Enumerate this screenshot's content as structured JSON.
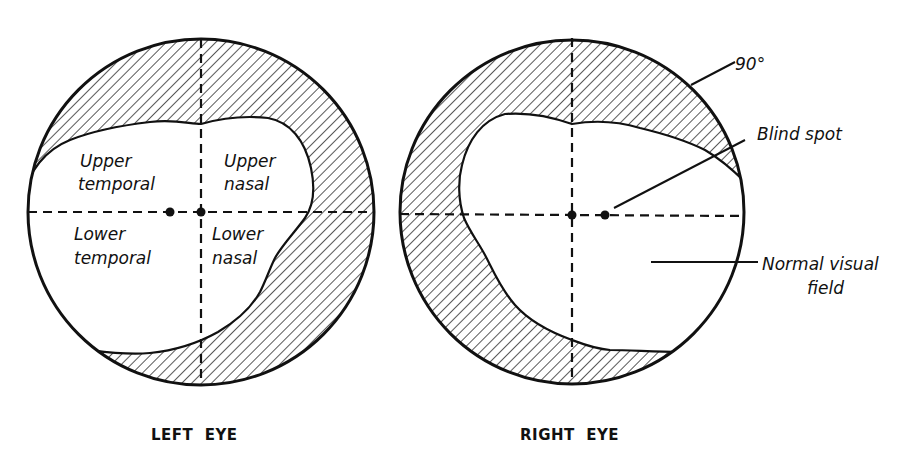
{
  "figure": {
    "left_eye": {
      "caption": "LEFT  EYE",
      "quadrants": {
        "upper_temporal": [
          "Upper",
          "temporal"
        ],
        "upper_nasal": [
          "Upper",
          "nasal"
        ],
        "lower_temporal": [
          "Lower",
          "temporal"
        ],
        "lower_nasal": [
          "Lower",
          "nasal"
        ]
      }
    },
    "right_eye": {
      "caption": "RIGHT  EYE",
      "annotations": {
        "outer_limit": "90°",
        "blind_spot": "Blind spot",
        "normal_field_line1": "Normal visual",
        "normal_field_line2": "field"
      }
    },
    "colors": {
      "ink": "#111111",
      "background": "#ffffff"
    }
  }
}
